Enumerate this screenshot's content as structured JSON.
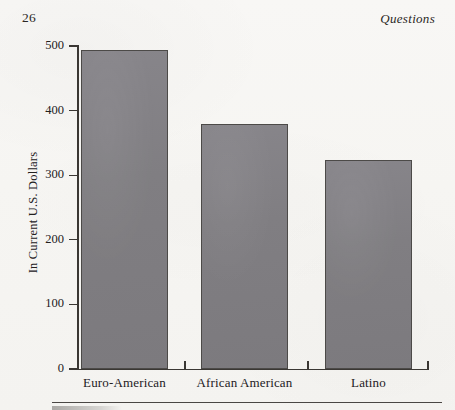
{
  "page": {
    "folio": "26",
    "running_head": "Questions",
    "paper_color": "#f7f6f3",
    "ink_color": "#23201d"
  },
  "chart_data": {
    "type": "bar",
    "title": "",
    "xlabel": "",
    "ylabel": "In Current U.S. Dollars",
    "categories": [
      "Euro-American",
      "African American",
      "Latino"
    ],
    "values": [
      494,
      379,
      324
    ],
    "ylim": [
      0,
      500
    ],
    "yticks": [
      0,
      100,
      200,
      300,
      400,
      500
    ],
    "ytick_labels": [
      "0",
      "100",
      "200",
      "300",
      "400",
      "500"
    ],
    "grid": false,
    "legend": null,
    "bar_color": "#807e82",
    "bar_edge_color": "#4c4a48",
    "axis_color": "#3a3733"
  }
}
